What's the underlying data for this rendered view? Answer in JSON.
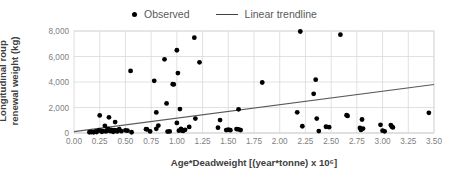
{
  "legend": {
    "position": "top-center",
    "entries": [
      {
        "label": "Observed",
        "marker": "scatter-dot-icon",
        "color": "#000000"
      },
      {
        "label": "Linear trendline",
        "marker": "trendline-segment-icon",
        "color": "#404040"
      }
    ]
  },
  "axes": {
    "x_title": "Age*Deadweight [(year*tonne) x 10⁶]",
    "y_title": "Longitudinal roup renewal weight (kg)",
    "x_ticks": [
      "0.00",
      "0.25",
      "0.50",
      "0.75",
      "1.00",
      "1.25",
      "1.50",
      "1.75",
      "2.00",
      "2.25",
      "2.50",
      "2.75",
      "3.00",
      "3.25",
      "3.50"
    ],
    "y_ticks": [
      "0",
      "2,000",
      "4,000",
      "6,000",
      "8,000"
    ]
  },
  "chart_data": {
    "type": "scatter",
    "title": "",
    "xlabel": "Age*Deadweight [(year*tonne) x 10⁶]",
    "ylabel": "Longitudinal roup renewal weight (kg)",
    "xlim": [
      0.0,
      3.5
    ],
    "ylim": [
      0,
      8000
    ],
    "xtick_step": 0.25,
    "ytick_step": 2000,
    "grid": true,
    "legend_position": "top-center",
    "series": [
      {
        "name": "Observed",
        "type": "scatter",
        "color": "#000000",
        "marker": "circle",
        "points": [
          [
            0.15,
            60
          ],
          [
            0.17,
            80
          ],
          [
            0.19,
            50
          ],
          [
            0.21,
            120
          ],
          [
            0.22,
            70
          ],
          [
            0.24,
            200
          ],
          [
            0.25,
            1380
          ],
          [
            0.26,
            180
          ],
          [
            0.27,
            90
          ],
          [
            0.28,
            150
          ],
          [
            0.3,
            560
          ],
          [
            0.31,
            120
          ],
          [
            0.32,
            200
          ],
          [
            0.33,
            330
          ],
          [
            0.34,
            1230
          ],
          [
            0.35,
            150
          ],
          [
            0.36,
            250
          ],
          [
            0.37,
            170
          ],
          [
            0.38,
            90
          ],
          [
            0.39,
            230
          ],
          [
            0.4,
            860
          ],
          [
            0.41,
            200
          ],
          [
            0.42,
            120
          ],
          [
            0.44,
            300
          ],
          [
            0.46,
            140
          ],
          [
            0.5,
            210
          ],
          [
            0.52,
            180
          ],
          [
            0.55,
            4870
          ],
          [
            0.56,
            60
          ],
          [
            0.7,
            300
          ],
          [
            0.71,
            290
          ],
          [
            0.74,
            120
          ],
          [
            0.78,
            4090
          ],
          [
            0.8,
            1610
          ],
          [
            0.8,
            330
          ],
          [
            0.82,
            580
          ],
          [
            0.88,
            5780
          ],
          [
            0.9,
            2320
          ],
          [
            0.91,
            110
          ],
          [
            0.93,
            120
          ],
          [
            0.96,
            3830
          ],
          [
            0.97,
            3810
          ],
          [
            1.0,
            6490
          ],
          [
            1.0,
            790
          ],
          [
            1.01,
            4700
          ],
          [
            1.02,
            180
          ],
          [
            1.03,
            1880
          ],
          [
            1.04,
            330
          ],
          [
            1.05,
            210
          ],
          [
            1.06,
            160
          ],
          [
            1.08,
            250
          ],
          [
            1.12,
            480
          ],
          [
            1.17,
            7480
          ],
          [
            1.18,
            1130
          ],
          [
            1.22,
            5540
          ],
          [
            1.4,
            420
          ],
          [
            1.42,
            1010
          ],
          [
            1.48,
            230
          ],
          [
            1.5,
            260
          ],
          [
            1.52,
            220
          ],
          [
            1.58,
            310
          ],
          [
            1.6,
            1860
          ],
          [
            1.6,
            280
          ],
          [
            1.62,
            230
          ],
          [
            1.83,
            3960
          ],
          [
            2.17,
            1620
          ],
          [
            2.2,
            7960
          ],
          [
            2.22,
            530
          ],
          [
            2.33,
            3070
          ],
          [
            2.35,
            4180
          ],
          [
            2.36,
            1130
          ],
          [
            2.38,
            150
          ],
          [
            2.45,
            490
          ],
          [
            2.48,
            460
          ],
          [
            2.59,
            7710
          ],
          [
            2.65,
            1400
          ],
          [
            2.66,
            1340
          ],
          [
            2.78,
            400
          ],
          [
            2.79,
            240
          ],
          [
            2.8,
            1060
          ],
          [
            2.81,
            350
          ],
          [
            2.98,
            640
          ],
          [
            3.0,
            180
          ],
          [
            3.02,
            130
          ],
          [
            3.08,
            620
          ],
          [
            3.09,
            500
          ],
          [
            3.1,
            440
          ],
          [
            3.45,
            1580
          ]
        ]
      },
      {
        "name": "Linear trendline",
        "type": "line",
        "color": "#595959",
        "endpoints": [
          [
            0.0,
            110
          ],
          [
            3.5,
            3800
          ]
        ]
      }
    ]
  }
}
